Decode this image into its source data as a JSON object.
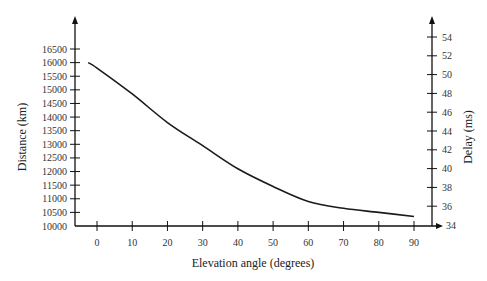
{
  "chart_data": {
    "type": "line",
    "title": "",
    "xlabel": "Elevation angle (degrees)",
    "ylabel": "Distance (km)",
    "y2label": "Delay (ms)",
    "x_ticks": [
      0,
      10,
      20,
      30,
      40,
      50,
      60,
      70,
      80,
      90
    ],
    "y_ticks": [
      10000,
      10500,
      11000,
      11500,
      12000,
      12500,
      13000,
      13500,
      14000,
      14500,
      15000,
      15500,
      16000,
      16500
    ],
    "y2_ticks": [
      34,
      36,
      38,
      40,
      42,
      44,
      46,
      48,
      50,
      52,
      54
    ],
    "xlim": [
      -5,
      95
    ],
    "ylim": [
      10000,
      17000
    ],
    "y2lim": [
      34,
      55
    ],
    "grid": false,
    "legend": null,
    "series": [
      {
        "name": "Distance",
        "x": [
          -2.5,
          0,
          10,
          20,
          30,
          40,
          50,
          60,
          70,
          80,
          90
        ],
        "values": [
          16000,
          15800,
          14850,
          13800,
          12950,
          12100,
          11450,
          10900,
          10650,
          10500,
          10350
        ]
      }
    ]
  },
  "labels": {
    "xlabel": "Elevation angle (degrees)",
    "ylabel": "Distance (km)",
    "y2label": "Delay (ms)"
  }
}
